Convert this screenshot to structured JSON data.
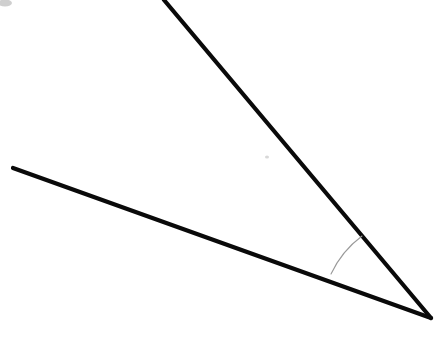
{
  "figure": {
    "background_color": "#ffffff",
    "width": 439,
    "height": 360,
    "line_color": "#0a0a0a",
    "line_width": 4.2,
    "arc_color": "#9a9a9a",
    "arc_width": 1.1,
    "vertex": {
      "label": "vertex",
      "x": 431,
      "y": 318
    },
    "rays": [
      {
        "name": "upper-ray",
        "label": "upper ray",
        "from": {
          "x": 431,
          "y": 318
        },
        "to": {
          "x": 164,
          "y": 0
        }
      },
      {
        "name": "lower-ray",
        "label": "lower ray",
        "from": {
          "x": 431,
          "y": 318
        },
        "to": {
          "x": 13,
          "y": 168
        }
      }
    ],
    "arc": {
      "name": "angle-arc",
      "label": "angle marker arc",
      "start": {
        "x": 362,
        "y": 236
      },
      "end": {
        "x": 331,
        "y": 274
      },
      "radius": 100,
      "sweep": "counterclockwise"
    },
    "artifacts": [
      {
        "name": "corner-smudge",
        "label": "scan smudge",
        "x": 5,
        "y": 3,
        "rx": 7,
        "ry": 3.5,
        "color": "#cfcfcf"
      },
      {
        "name": "paper-speck",
        "label": "paper speck",
        "x": 267,
        "y": 157,
        "rx": 2,
        "ry": 1.6,
        "color": "#d8d8d8"
      }
    ]
  }
}
